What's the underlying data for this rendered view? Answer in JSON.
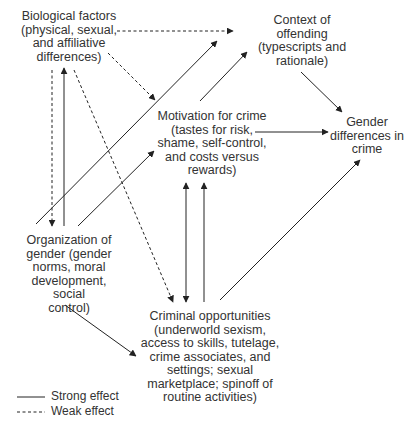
{
  "nodes": {
    "biological": {
      "label": "Biological factors\n(physical, sexual,\nand affiliative\ndifferences)"
    },
    "context": {
      "label": "Context of\noffending\n(typescripts and\nrationale)"
    },
    "motivation": {
      "label": "Motivation for crime\n(tastes for risk,\nshame, self-control,\nand costs versus\nrewards)"
    },
    "gender_diff": {
      "label": "Gender\ndifferences in\ncrime"
    },
    "organization": {
      "label": "Organization of\ngender (gender\nnorms, moral\ndevelopment, social\ncontrol)"
    },
    "opportunities": {
      "label": "Criminal opportunities\n(underworld sexism,\naccess to skills, tutelage,\ncrime associates, and\nsettings; sexual\nmarketplace; spinoff of\nroutine activities)"
    }
  },
  "edges": [
    {
      "from": "biological",
      "to": "context",
      "style": "weak"
    },
    {
      "from": "biological",
      "to": "motivation",
      "style": "weak"
    },
    {
      "from": "biological",
      "to": "organization",
      "style": "weak"
    },
    {
      "from": "biological",
      "to": "opportunities",
      "style": "weak"
    },
    {
      "from": "organization",
      "to": "biological",
      "style": "strong"
    },
    {
      "from": "organization",
      "to": "context",
      "style": "strong"
    },
    {
      "from": "organization",
      "to": "motivation",
      "style": "strong"
    },
    {
      "from": "organization",
      "to": "opportunities",
      "style": "strong"
    },
    {
      "from": "motivation",
      "to": "context",
      "style": "strong"
    },
    {
      "from": "motivation",
      "to": "gender_diff",
      "style": "strong"
    },
    {
      "from": "motivation",
      "to": "opportunities",
      "style": "strong",
      "bidirectional": true
    },
    {
      "from": "opportunities",
      "to": "motivation",
      "style": "strong"
    },
    {
      "from": "context",
      "to": "gender_diff",
      "style": "strong"
    },
    {
      "from": "opportunities",
      "to": "gender_diff",
      "style": "strong"
    }
  ],
  "legend": {
    "strong": "Strong effect",
    "weak": "Weak effect"
  },
  "colors": {
    "line": "#222222",
    "text": "#333333",
    "background": "#ffffff"
  }
}
